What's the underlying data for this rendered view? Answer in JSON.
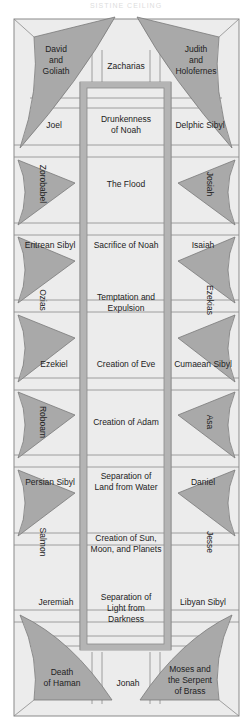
{
  "title": "SISTINE CEILING",
  "colors": {
    "background": "#ffffff",
    "panel": "#ececec",
    "spandrel": "#a9a9a9",
    "frame_band": "#b4b4b4",
    "line": "#7a7a7a",
    "text": "#222222"
  },
  "corners": {
    "top_left": "David\nand\nGoliath",
    "top_right": "Judith\nand\nHolofernes",
    "bottom_left": "Death\nof Haman",
    "bottom_right": "Moses and\nthe Serpent\nof Brass"
  },
  "prophets_top": "Zacharias",
  "prophets_bottom": "Jonah",
  "rows": [
    {
      "left": "Joel",
      "center": "Drunkenness\nof Noah",
      "right": "Delphic Sibyl"
    },
    {
      "left": "Zorobabel",
      "center": "The Flood",
      "right": "Josiah",
      "type": "spandrel"
    },
    {
      "left": "Eritrean Sibyl",
      "center": "Sacrifice of Noah",
      "right": "Isaiah"
    },
    {
      "left": "Ozias",
      "center": "Temptation and\nExpulsion",
      "right": "Ezekias",
      "type": "spandrel"
    },
    {
      "left": "Ezekiel",
      "center": "Creation of Eve",
      "right": "Cumaean Sibyl"
    },
    {
      "left": "Roboam",
      "center": "Creation of Adam",
      "right": "Asa",
      "type": "spandrel"
    },
    {
      "left": "Persian Sibyl",
      "center": "Separation of\nLand from Water",
      "right": "Daniel"
    },
    {
      "left": "Salmon",
      "center": "Creation of Sun,\nMoon, and Planets",
      "right": "Jesse",
      "type": "spandrel"
    },
    {
      "left": "Jeremiah",
      "center": "Separation of\nLight from\nDarkness",
      "right": "Libyan Sibyl"
    }
  ]
}
